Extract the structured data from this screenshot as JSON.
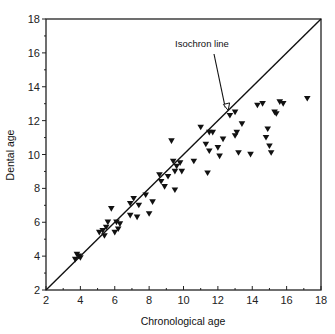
{
  "chart_data": {
    "type": "scatter",
    "title": "",
    "xlabel": "Chronological age",
    "ylabel": "Dental age",
    "xlim": [
      2,
      18
    ],
    "ylim": [
      2,
      18
    ],
    "xticks": [
      2,
      4,
      6,
      8,
      10,
      12,
      14,
      16,
      18
    ],
    "yticks": [
      2,
      4,
      6,
      8,
      10,
      12,
      14,
      16,
      18
    ],
    "grid": false,
    "legend": null,
    "marker": "filled-down-triangle",
    "reference_line": {
      "label": "Isochron line",
      "x": [
        2,
        18
      ],
      "y": [
        2,
        18
      ]
    },
    "annotations": [
      {
        "text": "Isochron line",
        "arrow_to": [
          12.6,
          12.6
        ]
      }
    ],
    "series": [
      {
        "name": "Dental vs chronological age",
        "points": [
          [
            3.7,
            3.8
          ],
          [
            3.9,
            4.0
          ],
          [
            4.0,
            3.9
          ],
          [
            3.8,
            4.1
          ],
          [
            5.1,
            5.4
          ],
          [
            5.3,
            5.5
          ],
          [
            5.4,
            5.2
          ],
          [
            5.6,
            6.0
          ],
          [
            5.5,
            5.7
          ],
          [
            6.0,
            5.4
          ],
          [
            6.2,
            5.6
          ],
          [
            6.3,
            5.9
          ],
          [
            6.1,
            6.0
          ],
          [
            5.8,
            6.8
          ],
          [
            6.9,
            7.1
          ],
          [
            7.1,
            7.4
          ],
          [
            6.9,
            6.4
          ],
          [
            7.3,
            6.3
          ],
          [
            7.4,
            7.0
          ],
          [
            7.8,
            7.6
          ],
          [
            8.0,
            6.5
          ],
          [
            8.2,
            7.2
          ],
          [
            8.6,
            8.8
          ],
          [
            8.9,
            8.1
          ],
          [
            8.7,
            8.4
          ],
          [
            9.1,
            8.7
          ],
          [
            9.5,
            7.9
          ],
          [
            9.3,
            10.8
          ],
          [
            9.4,
            9.6
          ],
          [
            9.6,
            9.3
          ],
          [
            9.8,
            9.5
          ],
          [
            9.9,
            9.0
          ],
          [
            9.5,
            9.0
          ],
          [
            10.6,
            9.6
          ],
          [
            11.0,
            11.6
          ],
          [
            11.3,
            10.6
          ],
          [
            11.5,
            11.3
          ],
          [
            11.7,
            11.3
          ],
          [
            11.5,
            10.2
          ],
          [
            11.4,
            8.9
          ],
          [
            12.0,
            10.4
          ],
          [
            12.1,
            9.9
          ],
          [
            12.3,
            10.9
          ],
          [
            12.7,
            12.3
          ],
          [
            13.0,
            11.1
          ],
          [
            13.1,
            11.3
          ],
          [
            13.2,
            10.1
          ],
          [
            13.4,
            11.8
          ],
          [
            13.0,
            12.5
          ],
          [
            13.9,
            10.0
          ],
          [
            14.3,
            12.9
          ],
          [
            14.6,
            13.0
          ],
          [
            14.9,
            11.5
          ],
          [
            14.8,
            11.0
          ],
          [
            15.1,
            10.1
          ],
          [
            15.0,
            10.5
          ],
          [
            15.3,
            12.5
          ],
          [
            15.4,
            12.4
          ],
          [
            15.6,
            13.1
          ],
          [
            15.8,
            13.0
          ],
          [
            17.2,
            13.3
          ]
        ]
      }
    ]
  }
}
